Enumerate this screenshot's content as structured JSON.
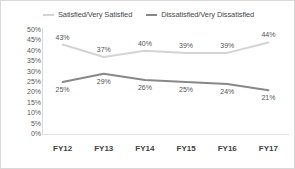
{
  "chart_data": {
    "type": "line",
    "title": "",
    "subtitle": "",
    "xlabel": "",
    "ylabel": "",
    "categories": [
      "FY12",
      "FY13",
      "FY14",
      "FY15",
      "FY16",
      "FY17"
    ],
    "series": [
      {
        "name": "Satisfied/Very Satisfied",
        "color": "#d4d4d4",
        "values": [
          43,
          37,
          40,
          39,
          39,
          44
        ],
        "labels": [
          "43%",
          "37%",
          "40%",
          "39%",
          "39%",
          "44%"
        ],
        "label_position": "above"
      },
      {
        "name": "Dissatisfied/Very Dissatisfied",
        "color": "#888888",
        "values": [
          25,
          29,
          26,
          25,
          24,
          21
        ],
        "labels": [
          "25%",
          "29%",
          "26%",
          "25%",
          "24%",
          "21%"
        ],
        "label_position": "below"
      }
    ],
    "ylim": [
      0,
      50
    ],
    "ytick_step": 5,
    "ytick_labels": [
      "50%",
      "45%",
      "40%",
      "35%",
      "30%",
      "25%",
      "20%",
      "15%",
      "10%",
      "5%",
      "0%"
    ],
    "grid": false,
    "legend_position": "top",
    "value_suffix": "%"
  },
  "legend": {
    "entries": [
      {
        "label": "Satisfied/Very Satisfied",
        "marker": "line-marker-light"
      },
      {
        "label": "Dissatisfied/Very Dissatisfied",
        "marker": "line-marker-dark"
      }
    ]
  }
}
